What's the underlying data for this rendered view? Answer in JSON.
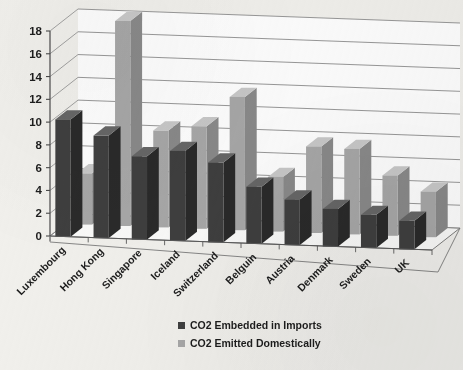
{
  "chart_data": {
    "type": "bar",
    "title": "",
    "subtitle": "",
    "xlabel": "",
    "ylabel": "",
    "ylim": [
      0,
      18
    ],
    "ytick_step": 2,
    "yticks": [
      "0",
      "2",
      "4",
      "6",
      "8",
      "10",
      "12",
      "14",
      "16",
      "18"
    ],
    "grid": true,
    "three_d": true,
    "legend_position": "bottom",
    "categories": [
      "Luxembourg",
      "Hong Kong",
      "Singapore",
      "Iceland",
      "Switzerland",
      "Belguin",
      "Austria",
      "Denmark",
      "Sweden",
      "UK"
    ],
    "series": [
      {
        "name": "CO2 Embedded in Imports",
        "color": "#3f3f3f",
        "values": [
          10.3,
          9.0,
          7.3,
          7.9,
          7.0,
          5.0,
          4.0,
          3.3,
          2.9,
          2.5
        ]
      },
      {
        "name": "CO2 Emitted Domestically",
        "color": "#a8a8a8",
        "values": [
          4.5,
          18.0,
          8.5,
          9.0,
          11.7,
          4.8,
          7.6,
          7.5,
          5.3,
          4.0
        ]
      }
    ]
  },
  "legend": {
    "items": [
      {
        "label": "CO2 Embedded in Imports",
        "color": "#3f3f3f"
      },
      {
        "label": "CO2 Emitted Domestically",
        "color": "#a8a8a8"
      }
    ]
  },
  "colors": {
    "background": "#f2f1ed",
    "plot_background": "#ffffff",
    "gridline": "#8d8d8d",
    "axis": "#6f6f6f",
    "series_dark_front": "#3f3f3f",
    "series_dark_top": "#676767",
    "series_dark_side": "#2a2a2a",
    "series_light_front": "#a8a8a8",
    "series_light_top": "#c9c9c9",
    "series_light_side": "#8a8a8a"
  }
}
